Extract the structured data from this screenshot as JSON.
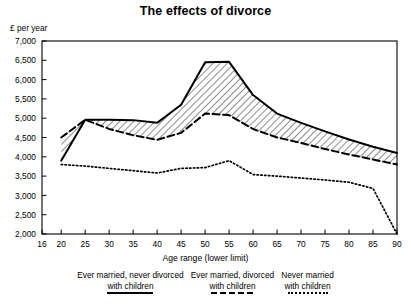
{
  "chart_data": {
    "type": "line",
    "title": "The effects of divorce",
    "xlabel": "Age range (lower limit)",
    "ylabel": "£ per year",
    "xlim": [
      16,
      90
    ],
    "ylim": [
      2000,
      7000
    ],
    "grid": false,
    "legend_position": "bottom",
    "xticks": [
      16,
      20,
      25,
      30,
      35,
      40,
      45,
      50,
      55,
      60,
      65,
      70,
      75,
      80,
      85,
      90
    ],
    "xtick_labels": [
      "16",
      "20",
      "25",
      "30",
      "35",
      "40",
      "45",
      "50",
      "55",
      "60",
      "65",
      "70",
      "75",
      "80",
      "85",
      "90"
    ],
    "yticks": [
      2000,
      2500,
      3000,
      3500,
      4000,
      4500,
      5000,
      5500,
      6000,
      6500,
      7000
    ],
    "ytick_labels": [
      "2,000",
      "2,500",
      "3,000",
      "3,500",
      "4,000",
      "4,500",
      "5,000",
      "5,500",
      "6,000",
      "6,500",
      "7,000"
    ],
    "x": [
      20,
      25,
      30,
      35,
      40,
      45,
      50,
      55,
      60,
      65,
      70,
      75,
      80,
      85,
      90
    ],
    "series": [
      {
        "name": "Ever married, never divorced with children",
        "style": "solid",
        "values": [
          3900,
          4960,
          4960,
          4950,
          4880,
          5350,
          6450,
          6460,
          5600,
          5120,
          4880,
          4660,
          4450,
          4260,
          4100
        ]
      },
      {
        "name": "Ever married, divorced with children",
        "style": "dashed",
        "values": [
          4500,
          4960,
          4720,
          4560,
          4440,
          4620,
          5120,
          5080,
          4720,
          4500,
          4360,
          4200,
          4060,
          3930,
          3800
        ]
      },
      {
        "name": "Never married with children",
        "style": "dotted",
        "values": [
          3800,
          3760,
          3700,
          3640,
          3580,
          3700,
          3720,
          3900,
          3540,
          3500,
          3450,
          3400,
          3340,
          3180,
          2000
        ]
      }
    ],
    "annotations": [
      {
        "type": "hatched-band",
        "between": [
          "Ever married, never divorced with children",
          "Ever married, divorced with children"
        ],
        "pattern": "diagonal-hatch"
      }
    ]
  },
  "legend": {
    "entries": [
      {
        "line1": "Ever married, never divorced",
        "line2": "with children",
        "style": "solid"
      },
      {
        "line1": "Ever married, divorced",
        "line2": "with children",
        "style": "dashed"
      },
      {
        "line1": "Never married",
        "line2": "with children",
        "style": "dotted"
      }
    ]
  },
  "colors": {
    "line": "#000000",
    "background": "#ffffff",
    "hatch": "#000000"
  }
}
